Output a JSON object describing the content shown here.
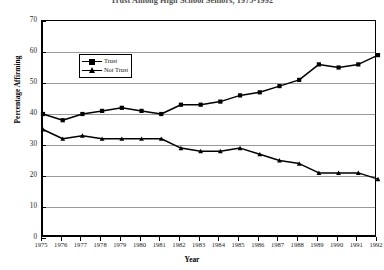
{
  "chart_data": {
    "type": "line",
    "title": "Trust Among High School Seniors, 1975-1992",
    "xlabel": "Year",
    "ylabel": "Percentage Affirming",
    "categories": [
      "1975",
      "1976",
      "1977",
      "1978",
      "1979",
      "1980",
      "1981",
      "1982",
      "1983",
      "1984",
      "1985",
      "1986",
      "1987",
      "1988",
      "1989",
      "1990",
      "1991",
      "1992"
    ],
    "ylim": [
      0,
      70
    ],
    "yticks": [
      0,
      10,
      20,
      30,
      40,
      50,
      60,
      70
    ],
    "grid": true,
    "legend_position": "top-left",
    "series": [
      {
        "name": "Trust",
        "marker": "square",
        "values": [
          40,
          38,
          40,
          41,
          42,
          41,
          40,
          43,
          43,
          44,
          46,
          47,
          49,
          51,
          56,
          55,
          56,
          59
        ]
      },
      {
        "name": "Not Trust",
        "marker": "triangle",
        "values": [
          35,
          32,
          33,
          32,
          32,
          32,
          32,
          29,
          28,
          28,
          29,
          27,
          25,
          24,
          21,
          21,
          21,
          19
        ]
      }
    ]
  },
  "legend": {
    "items": [
      {
        "label": "Trust"
      },
      {
        "label": "Not Trust"
      }
    ]
  },
  "axes": {
    "y_tick_labels": [
      "0",
      "10",
      "20",
      "30",
      "40",
      "50",
      "60",
      "70"
    ],
    "x_tick_labels": [
      "1975",
      "1976",
      "1977",
      "1978",
      "1979",
      "1980",
      "1981",
      "1982",
      "1983",
      "1984",
      "1985",
      "1986",
      "1987",
      "1988",
      "1989",
      "1990",
      "1991",
      "1992"
    ]
  }
}
